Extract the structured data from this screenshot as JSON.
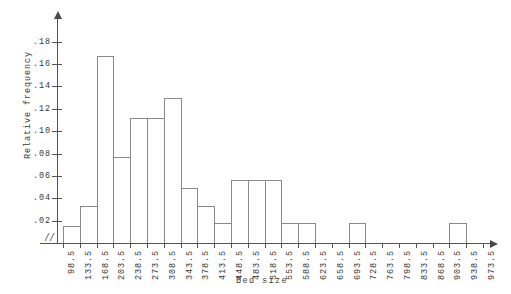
{
  "chart_data": {
    "type": "bar",
    "title": "",
    "subtitle": "",
    "xlabel": "Bed size",
    "ylabel": "Relative frequency",
    "grid": false,
    "legend": "none",
    "bin_width": 35,
    "xlim": [
      98.5,
      973.5
    ],
    "ylim": [
      0,
      0.19
    ],
    "x_axis_break": "//",
    "y_ticks": [
      0.02,
      0.04,
      0.06,
      0.08,
      0.1,
      0.12,
      0.14,
      0.16,
      0.18
    ],
    "y_tick_labels": [
      ".02",
      ".04",
      ".06",
      ".08",
      ".10",
      ".12",
      ".14",
      ".16",
      ".18"
    ],
    "x_ticks": [
      98.5,
      133.5,
      168.5,
      203.5,
      238.5,
      273.5,
      308.5,
      343.5,
      378.5,
      413.5,
      448.5,
      483.5,
      518.5,
      553.5,
      588.5,
      623.5,
      658.5,
      693.5,
      728.5,
      763.5,
      798.5,
      833.5,
      868.5,
      903.5,
      938.5,
      973.5
    ],
    "x_tick_labels": [
      "98.5",
      "133.5",
      "168.5",
      "203.5",
      "238.5",
      "273.5",
      "308.5",
      "343.5",
      "378.5",
      "413.5",
      "448.5",
      "483.5",
      "518.5",
      "553.5",
      "588.5",
      "623.5",
      "658.5",
      "693.5",
      "728.5",
      "763.5",
      "798.5",
      "833.5",
      "868.5",
      "903.5",
      "938.5",
      "973.5"
    ],
    "bin_edges": [
      98.5,
      133.5,
      168.5,
      203.5,
      238.5,
      273.5,
      308.5,
      343.5,
      378.5,
      413.5,
      448.5,
      483.5,
      518.5,
      553.5,
      588.5,
      623.5,
      658.5,
      693.5,
      728.5,
      763.5,
      798.5,
      833.5,
      868.5,
      903.5,
      938.5,
      973.5
    ],
    "categories": [
      "98.5-133.5",
      "133.5-168.5",
      "168.5-203.5",
      "203.5-238.5",
      "238.5-273.5",
      "273.5-308.5",
      "308.5-343.5",
      "343.5-378.5",
      "378.5-413.5",
      "413.5-448.5",
      "448.5-483.5",
      "483.5-518.5",
      "518.5-553.5",
      "553.5-588.5",
      "588.5-623.5",
      "623.5-658.5",
      "658.5-693.5",
      "693.5-728.5",
      "728.5-763.5",
      "763.5-798.5",
      "798.5-833.5",
      "833.5-868.5",
      "868.5-903.5",
      "903.5-938.5",
      "938.5-973.5"
    ],
    "values": [
      0.015,
      0.033,
      0.167,
      0.077,
      0.112,
      0.112,
      0.13,
      0.049,
      0.033,
      0.018,
      0.056,
      0.056,
      0.056,
      0.018,
      0.018,
      0,
      0,
      0.018,
      0,
      0,
      0,
      0,
      0,
      0.018,
      0
    ]
  }
}
